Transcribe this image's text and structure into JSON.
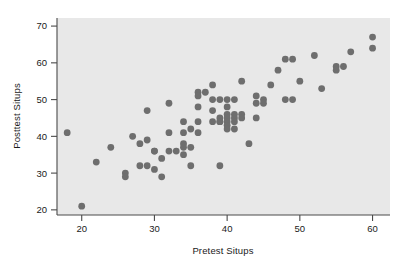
{
  "chart_data": {
    "type": "scatter",
    "title": "",
    "xlabel": "Pretest Situps",
    "ylabel": "Posttest Situps",
    "xlim": [
      16.6,
      62.4
    ],
    "ylim": [
      18.6,
      72.2
    ],
    "xticks": [
      20,
      30,
      40,
      50,
      60
    ],
    "xticklabels": [
      "20",
      "30",
      "40",
      "50",
      "60"
    ],
    "yticks": [
      20,
      30,
      40,
      50,
      60,
      70
    ],
    "yticklabels": [
      "20",
      "30",
      "40",
      "50",
      "60",
      "70"
    ],
    "grid": false,
    "legend": null,
    "marker": "filled-circle",
    "marker_color": "#6e6e6e",
    "marker_size": 3.4,
    "panel_color": "#e8e8e8",
    "points": [
      [
        18,
        41
      ],
      [
        20,
        21
      ],
      [
        22,
        33
      ],
      [
        24,
        37
      ],
      [
        26,
        30
      ],
      [
        26,
        29
      ],
      [
        27,
        40
      ],
      [
        28,
        38
      ],
      [
        28,
        32
      ],
      [
        29,
        47
      ],
      [
        29,
        39
      ],
      [
        29,
        32
      ],
      [
        30,
        36
      ],
      [
        30,
        36
      ],
      [
        30,
        31
      ],
      [
        31,
        34
      ],
      [
        31,
        29
      ],
      [
        32,
        49
      ],
      [
        32,
        41
      ],
      [
        32,
        36
      ],
      [
        33,
        36
      ],
      [
        34,
        44
      ],
      [
        34,
        41
      ],
      [
        34,
        38
      ],
      [
        34,
        37
      ],
      [
        34,
        35
      ],
      [
        35,
        42
      ],
      [
        35,
        37
      ],
      [
        35,
        32
      ],
      [
        36,
        52
      ],
      [
        36,
        51
      ],
      [
        36,
        48
      ],
      [
        36,
        44
      ],
      [
        36,
        41
      ],
      [
        37,
        52
      ],
      [
        38,
        54
      ],
      [
        38,
        50
      ],
      [
        38,
        47
      ],
      [
        38,
        44
      ],
      [
        39,
        50
      ],
      [
        39,
        45
      ],
      [
        39,
        44
      ],
      [
        39,
        44
      ],
      [
        39,
        32
      ],
      [
        40,
        50
      ],
      [
        40,
        48
      ],
      [
        40,
        46
      ],
      [
        40,
        45
      ],
      [
        40,
        44
      ],
      [
        40,
        43
      ],
      [
        40,
        42
      ],
      [
        41,
        50
      ],
      [
        41,
        46
      ],
      [
        41,
        45
      ],
      [
        41,
        44
      ],
      [
        41,
        42
      ],
      [
        42,
        55
      ],
      [
        42,
        46
      ],
      [
        42,
        45
      ],
      [
        43,
        38
      ],
      [
        44,
        51
      ],
      [
        44,
        49
      ],
      [
        44,
        45
      ],
      [
        45,
        50
      ],
      [
        45,
        49
      ],
      [
        46,
        54
      ],
      [
        47,
        58
      ],
      [
        48,
        61
      ],
      [
        48,
        50
      ],
      [
        49,
        61
      ],
      [
        49,
        50
      ],
      [
        50,
        55
      ],
      [
        52,
        62
      ],
      [
        53,
        53
      ],
      [
        55,
        59
      ],
      [
        55,
        58
      ],
      [
        56,
        59
      ],
      [
        57,
        63
      ],
      [
        60,
        67
      ],
      [
        60,
        64
      ]
    ]
  },
  "axes": {
    "xlabel": "Pretest Situps",
    "ylabel": "Posttest Situps"
  }
}
